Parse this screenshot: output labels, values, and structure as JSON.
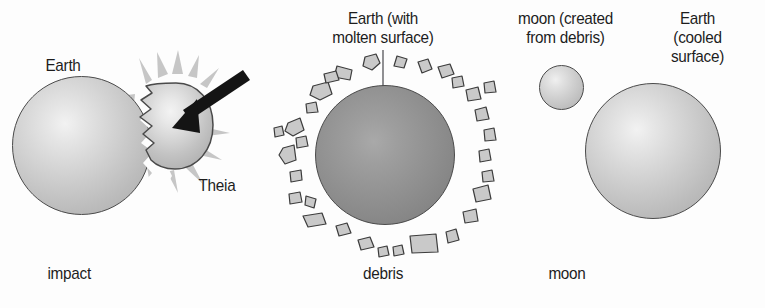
{
  "figure": {
    "background_color": "#fdfdfd",
    "ink_color": "#1d1d1d",
    "outline_color": "#4a4a4a"
  },
  "panels": [
    {
      "id": "impact",
      "caption": "impact",
      "labels": [
        {
          "name": "earth",
          "text": "Earth"
        },
        {
          "name": "theia",
          "text": "Theia"
        }
      ],
      "bodies": [
        {
          "name": "earth",
          "shape": "sphere",
          "shading": "light",
          "cx": 81,
          "cy": 145,
          "d": 139
        },
        {
          "name": "theia",
          "shape": "sphere-notched",
          "shading": "light",
          "cx": 170,
          "cy": 126,
          "d": 87
        }
      ],
      "annotations": [
        {
          "name": "impact-arrow",
          "type": "arrow",
          "color": "#1a1a1a"
        },
        {
          "name": "impact-burst",
          "type": "starburst",
          "color": "#c4c4c4"
        },
        {
          "name": "collision-seam",
          "type": "jagged-edge"
        }
      ]
    },
    {
      "id": "debris",
      "caption": "debris",
      "labels": [
        {
          "name": "molten-earth",
          "text": "Earth (with\nmolten surface)"
        }
      ],
      "bodies": [
        {
          "name": "molten-earth",
          "shape": "sphere",
          "shading": "molten",
          "cx": 385,
          "cy": 155,
          "d": 140
        }
      ],
      "annotations": [
        {
          "name": "leader-line",
          "type": "line",
          "color": "#555555"
        },
        {
          "name": "debris-ring",
          "type": "fragments",
          "count": 31,
          "fill": "#c8c8c8"
        }
      ]
    },
    {
      "id": "moon",
      "caption": "moon",
      "labels": [
        {
          "name": "new-moon",
          "text": "moon (created\nfrom debris)"
        },
        {
          "name": "cooled-earth",
          "text": "Earth\n(cooled\nsurface)"
        }
      ],
      "bodies": [
        {
          "name": "new-moon",
          "shape": "sphere",
          "shading": "small",
          "cx": 561,
          "cy": 87,
          "d": 45
        },
        {
          "name": "cooled-earth",
          "shape": "sphere",
          "shading": "light",
          "cx": 653,
          "cy": 151,
          "d": 136
        }
      ],
      "annotations": []
    }
  ],
  "text": {
    "earth": "Earth",
    "theia": "Theia",
    "molten_earth": "Earth (with\nmolten surface)",
    "new_moon": "moon (created\nfrom debris)",
    "cooled_earth": "Earth\n(cooled\nsurface)",
    "caption_impact": "impact",
    "caption_debris": "debris",
    "caption_moon": "moon"
  }
}
